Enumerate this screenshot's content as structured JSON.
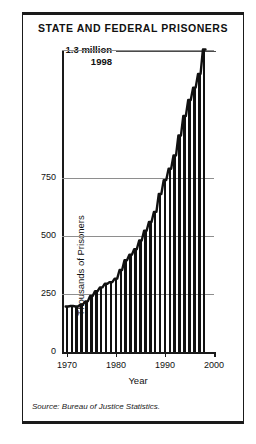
{
  "title": "STATE AND FEDERAL PRISONERS",
  "annotation": {
    "value_label": "1.3 million",
    "year_label": "1998"
  },
  "source": "Source: Bureau of Justice Statistics.",
  "axes": {
    "xlabel": "Year",
    "ylabel": "Thousands of Prisoners",
    "ytick_labels": [
      "0",
      "250",
      "500",
      "750"
    ],
    "xtick_labels": [
      "1970",
      "1980",
      "1990",
      "2000"
    ]
  },
  "colors": {
    "bar": "#111111",
    "grid": "#8e8e8e",
    "axis": "#1a1a1a",
    "background": "#ffffff"
  },
  "chart_data": {
    "type": "bar",
    "title": "STATE AND FEDERAL PRISONERS",
    "xlabel": "Year",
    "ylabel": "Thousands of Prisoners",
    "xlim": [
      1969,
      2000
    ],
    "ylim": [
      0,
      1300
    ],
    "yticks": [
      0,
      250,
      500,
      750
    ],
    "xticks": [
      1970,
      1980,
      1990,
      2000
    ],
    "grid": true,
    "legend": null,
    "annotations": [
      {
        "text": "1.3 million 1998",
        "x": 1998,
        "y": 1300
      }
    ],
    "categories": [
      1970,
      1971,
      1972,
      1973,
      1974,
      1975,
      1976,
      1977,
      1978,
      1979,
      1980,
      1981,
      1982,
      1983,
      1984,
      1985,
      1986,
      1987,
      1988,
      1989,
      1990,
      1991,
      1992,
      1993,
      1994,
      1995,
      1996,
      1997,
      1998
    ],
    "values": [
      196,
      198,
      196,
      204,
      218,
      241,
      262,
      278,
      294,
      301,
      316,
      353,
      395,
      419,
      443,
      480,
      522,
      560,
      603,
      680,
      740,
      789,
      846,
      932,
      1016,
      1085,
      1138,
      1197,
      1302
    ]
  }
}
